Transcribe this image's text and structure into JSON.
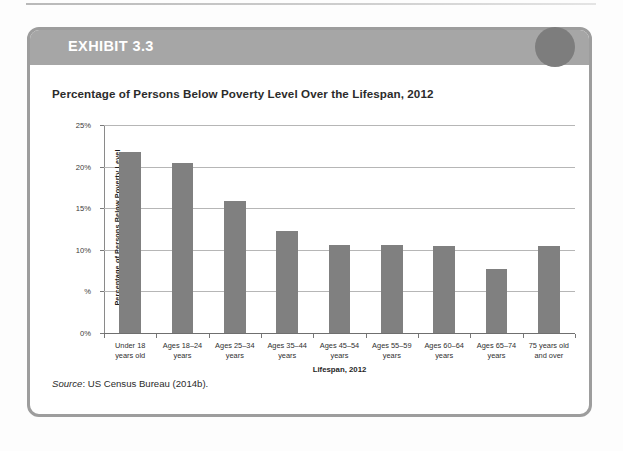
{
  "exhibit": {
    "label": "EXHIBIT 3.3",
    "header_color": "#a6a6a6",
    "dot_color": "#7d7d7d",
    "border_color": "#9d9d9d"
  },
  "chart_title": "Percentage of Persons Below Poverty Level Over the Lifespan, 2012",
  "source_note": {
    "prefix": "Source",
    "text": ": US Census Bureau (2014b)."
  },
  "chart_data": {
    "type": "bar",
    "title": "Percentage of Persons Below Poverty Level Over the Lifespan, 2012",
    "xlabel": "Lifespan, 2012",
    "ylabel": "Percentage of Persons Below Poverty Level",
    "categories": [
      "Under 18\nyears old",
      "Ages 18–24\nyears",
      "Ages 25–34\nyears",
      "Ages 35–44\nyears",
      "Ages 45–54\nyears",
      "Ages 55–59\nyears",
      "Ages 60–64\nyears",
      "Ages 65–74\nyears",
      "75 years old\nand over"
    ],
    "category_lines": [
      [
        "Under 18",
        "years old"
      ],
      [
        "Ages 18–24",
        "years"
      ],
      [
        "Ages 25–34",
        "years"
      ],
      [
        "Ages 35–44",
        "years"
      ],
      [
        "Ages 45–54",
        "years"
      ],
      [
        "Ages 55–59",
        "years"
      ],
      [
        "Ages 60–64",
        "years"
      ],
      [
        "Ages 65–74",
        "years"
      ],
      [
        "75 years old",
        "and over"
      ]
    ],
    "values": [
      21.8,
      20.4,
      15.9,
      12.3,
      10.6,
      10.6,
      10.5,
      7.7,
      10.4
    ],
    "ylim": [
      0,
      25
    ],
    "yticks": [
      0,
      5,
      10,
      15,
      20,
      25
    ],
    "ytick_labels": [
      "0%",
      "%",
      "10%",
      "15%",
      "20%",
      "25%"
    ],
    "grid": true,
    "legend": "none",
    "bar_color": "#808080"
  }
}
